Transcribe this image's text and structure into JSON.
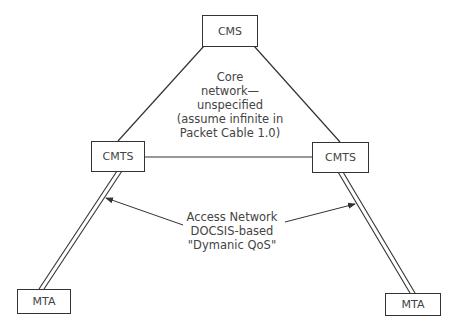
{
  "nodes": {
    "cms": {
      "label": "CMS"
    },
    "cmts_left": {
      "label": "CMTS"
    },
    "cmts_right": {
      "label": "CMTS"
    },
    "mta_left": {
      "label": "MTA"
    },
    "mta_right": {
      "label": "MTA"
    }
  },
  "labels": {
    "core_network": {
      "lines": [
        "Core",
        "network—",
        "unspecified",
        "(assume infinite in",
        "Packet Cable 1.0)"
      ]
    },
    "access_network": {
      "lines": [
        "Access Network",
        "DOCSIS-based",
        "\"Dymanic QoS\""
      ]
    }
  },
  "colors": {
    "line": "#333333",
    "text": "#444444",
    "background": "#ffffff"
  }
}
